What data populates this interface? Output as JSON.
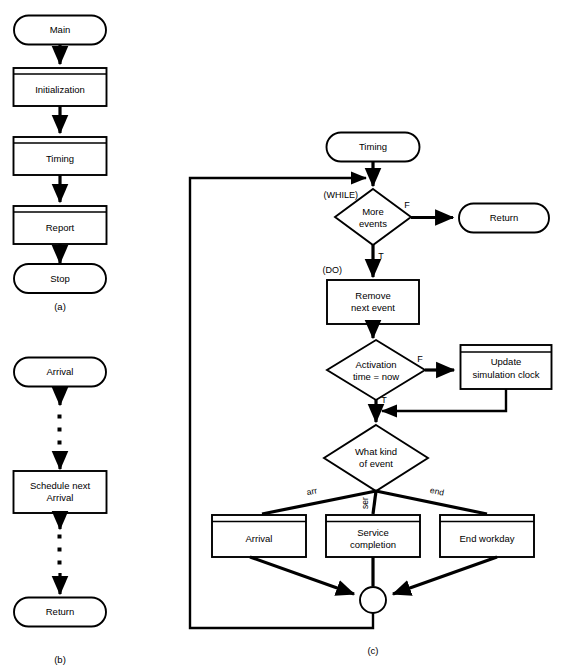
{
  "figure": {
    "captions": [
      {
        "id": "a",
        "text": "(a)",
        "x": 60,
        "y": 307
      },
      {
        "id": "b",
        "text": "(b)",
        "x": 60,
        "y": 660
      },
      {
        "id": "c",
        "text": "(c)",
        "x": 373,
        "y": 651
      }
    ]
  },
  "panel_a": {
    "caption": "(a)",
    "nodes": [
      {
        "name": "main",
        "type": "terminator",
        "label": "Main",
        "cx": 60,
        "cy": 30,
        "w": 92,
        "h": 29
      },
      {
        "name": "initialization",
        "type": "predefined-process",
        "label": "Initialization",
        "cx": 60,
        "cy": 87,
        "w": 93,
        "h": 38
      },
      {
        "name": "timing",
        "type": "predefined-process",
        "label": "Timing",
        "cx": 60,
        "cy": 156,
        "w": 93,
        "h": 38
      },
      {
        "name": "report",
        "type": "predefined-process",
        "label": "Report",
        "cx": 60,
        "cy": 225,
        "w": 93,
        "h": 38
      },
      {
        "name": "stop",
        "type": "terminator",
        "label": "Stop",
        "cx": 60,
        "cy": 278,
        "w": 92,
        "h": 29
      }
    ]
  },
  "panel_b": {
    "caption": "(b)",
    "nodes": [
      {
        "name": "arrival-entry",
        "type": "terminator",
        "label": "Arrival",
        "cx": 60,
        "cy": 372,
        "w": 92,
        "h": 29
      },
      {
        "name": "schedule-next-arrival",
        "type": "process",
        "label_line1": "Schedule next",
        "label_line2": "Arrival",
        "cx": 60,
        "cy": 492,
        "w": 93,
        "h": 42
      },
      {
        "name": "return-exit",
        "type": "terminator",
        "label": "Return",
        "cx": 60,
        "cy": 612,
        "w": 92,
        "h": 29
      }
    ],
    "ellipsis_dots": [
      {
        "x": 60,
        "y": 417
      },
      {
        "x": 60,
        "y": 430
      },
      {
        "x": 60,
        "y": 443
      },
      {
        "x": 60,
        "y": 537
      },
      {
        "x": 60,
        "y": 550
      },
      {
        "x": 60,
        "y": 563
      }
    ]
  },
  "panel_c": {
    "caption": "(c)",
    "nodes": [
      {
        "name": "timing-entry",
        "type": "terminator",
        "label": "Timing",
        "cx": 373,
        "cy": 147,
        "w": 93,
        "h": 29
      },
      {
        "name": "more-events-decision",
        "type": "decision",
        "label_line1": "More",
        "label_line2": "events",
        "cx": 373,
        "cy": 217,
        "w": 76,
        "h": 56
      },
      {
        "name": "return-exit",
        "type": "terminator",
        "label": "Return",
        "cx": 504,
        "cy": 218,
        "w": 90,
        "h": 29
      },
      {
        "name": "remove-next-event",
        "type": "process",
        "label_line1": "Remove",
        "label_line2": "next event",
        "cx": 373,
        "cy": 302,
        "w": 92,
        "h": 44
      },
      {
        "name": "activation-time-decision",
        "type": "decision",
        "label_line1": "Activation",
        "label_line2": "time = now",
        "cx": 376,
        "cy": 370,
        "w": 98,
        "h": 60
      },
      {
        "name": "update-simulation-clock",
        "type": "predefined-process",
        "label_line1": "Update",
        "label_line2": "simulation clock",
        "cx": 506,
        "cy": 367,
        "w": 91,
        "h": 44
      },
      {
        "name": "what-kind-of-event-decision",
        "type": "decision",
        "label_line1": "What kind",
        "label_line2": "of event",
        "cx": 376,
        "cy": 458,
        "w": 103,
        "h": 66
      },
      {
        "name": "arrival-routine",
        "type": "predefined-process",
        "label": "Arrival",
        "cx": 259,
        "cy": 536,
        "w": 94,
        "h": 42
      },
      {
        "name": "service-completion-routine",
        "type": "predefined-process",
        "label_line1": "Service",
        "label_line2": "completion",
        "cx": 373,
        "cy": 536,
        "w": 94,
        "h": 42
      },
      {
        "name": "end-workday-routine",
        "type": "predefined-process",
        "label": "End workday",
        "cx": 487,
        "cy": 536,
        "w": 94,
        "h": 42
      },
      {
        "name": "merge-junction",
        "type": "connector",
        "label": "",
        "cx": 373,
        "cy": 600,
        "r": 13
      }
    ],
    "edge_labels": [
      {
        "name": "while-keyword",
        "text": "(WHILE)",
        "x": 329,
        "y": 196
      },
      {
        "name": "do-keyword",
        "text": "(DO)",
        "x": 320,
        "y": 271
      },
      {
        "name": "more-events-false",
        "text": "F",
        "x": 407,
        "y": 207
      },
      {
        "name": "more-events-true",
        "text": "T",
        "x": 381,
        "y": 257
      },
      {
        "name": "activation-false",
        "text": "F",
        "x": 418,
        "y": 362
      },
      {
        "name": "activation-true",
        "text": "T",
        "x": 384,
        "y": 401
      },
      {
        "name": "branch-arr",
        "text": "arr",
        "x": 315,
        "y": 494,
        "rotate": -33
      },
      {
        "name": "branch-ser",
        "text": "ser",
        "x": 367,
        "y": 501,
        "rotate": -90
      },
      {
        "name": "branch-end",
        "text": "end",
        "x": 437,
        "y": 494,
        "rotate": 33
      }
    ]
  },
  "colors": {
    "stroke": "#000000",
    "fill": "#ffffff",
    "background": "#ffffff"
  }
}
